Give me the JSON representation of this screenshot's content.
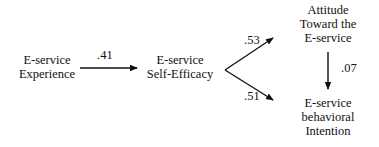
{
  "diagram": {
    "type": "path-model",
    "nodes": [
      {
        "id": "experience",
        "lines": [
          "E-service",
          "Experience"
        ]
      },
      {
        "id": "self_efficacy",
        "lines": [
          "E-service",
          "Self-Efficacy"
        ]
      },
      {
        "id": "attitude",
        "lines": [
          "Attitude",
          "Toward the",
          "E-service"
        ]
      },
      {
        "id": "intention",
        "lines": [
          "E-service",
          "behavioral",
          "Intention"
        ]
      }
    ],
    "edges": [
      {
        "from": "experience",
        "to": "self_efficacy",
        "coefficient": ".41"
      },
      {
        "from": "self_efficacy",
        "to": "attitude",
        "coefficient": ".53"
      },
      {
        "from": "self_efficacy",
        "to": "intention",
        "coefficient": ".51"
      },
      {
        "from": "attitude",
        "to": "intention",
        "coefficient": ".07"
      }
    ],
    "colors": {
      "line": "#111111",
      "background": "#ffffff"
    }
  }
}
